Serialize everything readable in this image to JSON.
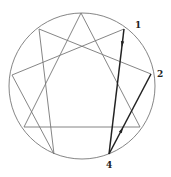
{
  "diagram": {
    "type": "enneagram",
    "circle": {
      "cx": 82,
      "cy": 86,
      "r": 73,
      "stroke": "#777777"
    },
    "points": {
      "9": [
        81,
        13
      ],
      "1": [
        124,
        29
      ],
      "2": [
        151,
        74
      ],
      "3": [
        140,
        127
      ],
      "4": [
        109,
        154
      ],
      "5": [
        54,
        154
      ],
      "6": [
        24,
        127
      ],
      "7": [
        12,
        75
      ],
      "8": [
        39,
        29
      ]
    },
    "labels": [
      {
        "text": "1",
        "x": 135,
        "y": 28
      },
      {
        "text": "2",
        "x": 157,
        "y": 77
      },
      {
        "text": "4",
        "x": 106,
        "y": 168
      }
    ],
    "thin_lines": [
      [
        "9",
        "3"
      ],
      [
        "3",
        "6"
      ],
      [
        "6",
        "9"
      ],
      [
        "2",
        "8"
      ],
      [
        "8",
        "5"
      ],
      [
        "5",
        "7"
      ],
      [
        "7",
        "1"
      ]
    ],
    "highlighted_lines": [
      {
        "from": "1",
        "to": "4",
        "arrow": "down"
      },
      {
        "from": "4",
        "to": "2",
        "arrow": "up"
      }
    ],
    "colors": {
      "thin": "#777777",
      "highlight": "#222222"
    }
  }
}
